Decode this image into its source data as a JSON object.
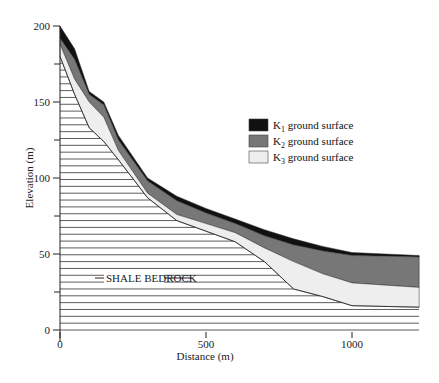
{
  "chart_data": {
    "type": "area",
    "title": "",
    "xlabel": "Distance (m)",
    "ylabel": "Elevation (m)",
    "xlim": [
      0,
      1230
    ],
    "ylim": [
      0,
      200
    ],
    "x_ticks": [
      0,
      500,
      1000
    ],
    "y_ticks": [
      0,
      50,
      100,
      150,
      200
    ],
    "legend": [
      "K1 ground surface",
      "K2 ground surface",
      "K3 ground surface"
    ],
    "legend_position": "upper right",
    "annotation": "SHALE BEDROCK",
    "x": [
      0,
      50,
      100,
      150,
      200,
      300,
      400,
      500,
      600,
      700,
      800,
      900,
      1000,
      1230
    ],
    "series": [
      {
        "name": "K1 ground surface",
        "color": "#111111",
        "values": [
          200,
          185,
          157,
          150,
          128,
          100,
          88,
          80,
          73,
          66,
          60,
          55,
          51,
          49
        ]
      },
      {
        "name": "K2 ground surface",
        "color": "#777777",
        "values": [
          192,
          178,
          155,
          148,
          125,
          98,
          85,
          77,
          70,
          62,
          56,
          52,
          49,
          48
        ]
      },
      {
        "name": "K3 ground surface",
        "color": "#eeeeee",
        "values": [
          188,
          165,
          150,
          140,
          118,
          90,
          76,
          70,
          64,
          54,
          45,
          37,
          31,
          28
        ]
      },
      {
        "name": "Shale bedrock surface",
        "color": "#ffffff",
        "values": [
          180,
          155,
          133,
          124,
          112,
          87,
          72,
          65,
          58,
          45,
          27,
          22,
          16,
          15
        ]
      }
    ]
  },
  "labels": {
    "xlabel": "Distance (m)",
    "ylabel": "Elevation (m)",
    "bedrock": "SHALE BEDROCK",
    "legend": [
      {
        "sym": "K",
        "sub": "1",
        "text": " ground surface"
      },
      {
        "sym": "K",
        "sub": "2",
        "text": " ground surface"
      },
      {
        "sym": "K",
        "sub": "3",
        "text": " ground surface"
      }
    ],
    "xticks": [
      "0",
      "500",
      "1000"
    ],
    "yticks": [
      "0",
      "50",
      "100",
      "150",
      "200"
    ]
  }
}
